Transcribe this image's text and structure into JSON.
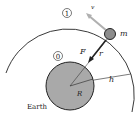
{
  "diagram": {
    "labels": {
      "orbit_marker": "1",
      "surface_marker": "0",
      "velocity": "v",
      "force": "F",
      "radius_vector": "r",
      "mass": "m",
      "earth_radius": "R",
      "altitude": "h",
      "earth": "Earth"
    },
    "colors": {
      "earth_fill": "#a9a9a9",
      "satellite_fill": "#8c8c8c",
      "velocity_arrow": "#b0b0b0",
      "stroke": "#222222"
    }
  }
}
